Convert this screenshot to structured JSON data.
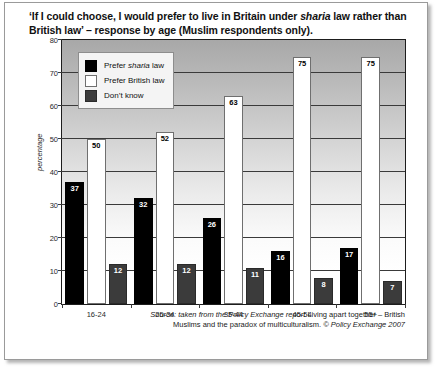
{
  "title": {
    "line1_pre": "‘If I could choose, I would prefer to live in Britain under ",
    "line1_em": "sharia",
    "line1_post": " law rather than",
    "line2": "British law’ – response by age (Muslim respondents only)."
  },
  "legend": {
    "items": [
      {
        "key": "sharia",
        "pre": "Prefer ",
        "em": "sharia",
        "post": " law",
        "color": "#000000"
      },
      {
        "key": "british",
        "pre": "Prefer British law",
        "em": "",
        "post": "",
        "color": "#ffffff"
      },
      {
        "key": "dk",
        "pre": "Don’t know",
        "em": "",
        "post": "",
        "color": "#3b3b3b"
      }
    ]
  },
  "source": {
    "line1_pre": "Source: taken from the Policy Exchange report ",
    "line1_rm": "Living apart together – British",
    "line2_rm": "Muslims and the paradox of multiculturalism.",
    "line2_post": " © Policy Exchange 2007"
  },
  "chart_data": {
    "type": "bar",
    "title": "‘If I could choose, I would prefer to live in Britain under sharia law rather than British law’ – response by age (Muslim respondents only).",
    "xlabel": "",
    "ylabel": "percentage",
    "ylim": [
      0,
      80
    ],
    "yticks": [
      0,
      10,
      20,
      30,
      40,
      50,
      60,
      70,
      80
    ],
    "grid": true,
    "legend_position": "top-left-inside",
    "categories": [
      "16-24",
      "25-34",
      "35-44",
      "45-54",
      "55+"
    ],
    "series": [
      {
        "name": "Prefer sharia law",
        "color": "#000000",
        "values": [
          37,
          32,
          26,
          16,
          17
        ]
      },
      {
        "name": "Prefer British law",
        "color": "#ffffff",
        "values": [
          50,
          52,
          63,
          75,
          75
        ]
      },
      {
        "name": "Don’t know",
        "color": "#3b3b3b",
        "values": [
          12,
          12,
          11,
          8,
          7
        ]
      }
    ]
  }
}
